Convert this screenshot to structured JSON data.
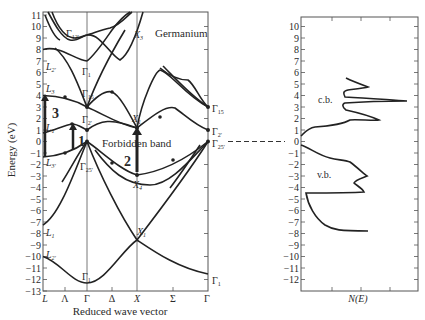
{
  "figure": {
    "band_panel": {
      "title": "Germanium",
      "ylabel": "Energy (eV)",
      "xlabel": "Reduced wave vector",
      "y_ticks": [
        "11",
        "10",
        "9",
        "8",
        "7",
        "6",
        "5",
        "4",
        "3",
        "2",
        "1",
        "0",
        "−1",
        "−2",
        "−3",
        "−4",
        "−5",
        "−6",
        "−7",
        "−8",
        "−9",
        "−10",
        "−11",
        "−12",
        "−13"
      ],
      "x_ticks": [
        "L",
        "Λ",
        "Γ",
        "Δ",
        "X",
        "Σ",
        "Γ"
      ],
      "forbidden_band_label": "Forbidden band",
      "transition_labels": [
        "1",
        "2",
        "3"
      ],
      "point_labels": {
        "gamma12": "Γ",
        "gamma12_sub": "12'",
        "gamma1_top": "Γ",
        "gamma1_top_sub": "1",
        "gamma15": "Γ",
        "gamma15_sub": "15",
        "gamma2": "Γ",
        "gamma2_sub": "2'",
        "gamma25": "Γ",
        "gamma25_sub": "25'",
        "gamma1_bottom": "Γ",
        "gamma1_bottom_sub": "1",
        "L2_top": "L",
        "L2_top_sub": "2'",
        "L3": "L",
        "L3_sub": "3",
        "L1_top": "L",
        "L1_top_sub": "1",
        "L3p": "L",
        "L3p_sub": "3'",
        "L1_bottom": "L",
        "L1_bottom_sub": "1",
        "L2_bottom": "L",
        "L2_bottom_sub": "2'",
        "X3": "X",
        "X3_sub": "3",
        "X1_top": "X",
        "X1_top_sub": "1",
        "X4": "X",
        "X4_sub": "4",
        "X1_bottom": "X",
        "X1_bottom_sub": "1",
        "right_gamma15": "Γ",
        "right_gamma15_sub": "15",
        "right_gamma2": "Γ",
        "right_gamma2_sub": "2'",
        "right_gamma25": "Γ",
        "right_gamma25_sub": "25'",
        "right_gamma1": "Γ",
        "right_gamma1_sub": "1"
      }
    },
    "dos_panel": {
      "xlabel": "N(E)",
      "y_ticks": [
        "10",
        "9",
        "8",
        "7",
        "6",
        "5",
        "4",
        "3",
        "2",
        "1",
        "0",
        "−1",
        "−2",
        "−3",
        "−4",
        "−5",
        "−6",
        "−7",
        "−8",
        "−9",
        "−10",
        "−11",
        "−12"
      ],
      "cb_label": "c.b.",
      "vb_label": "v.b."
    }
  }
}
